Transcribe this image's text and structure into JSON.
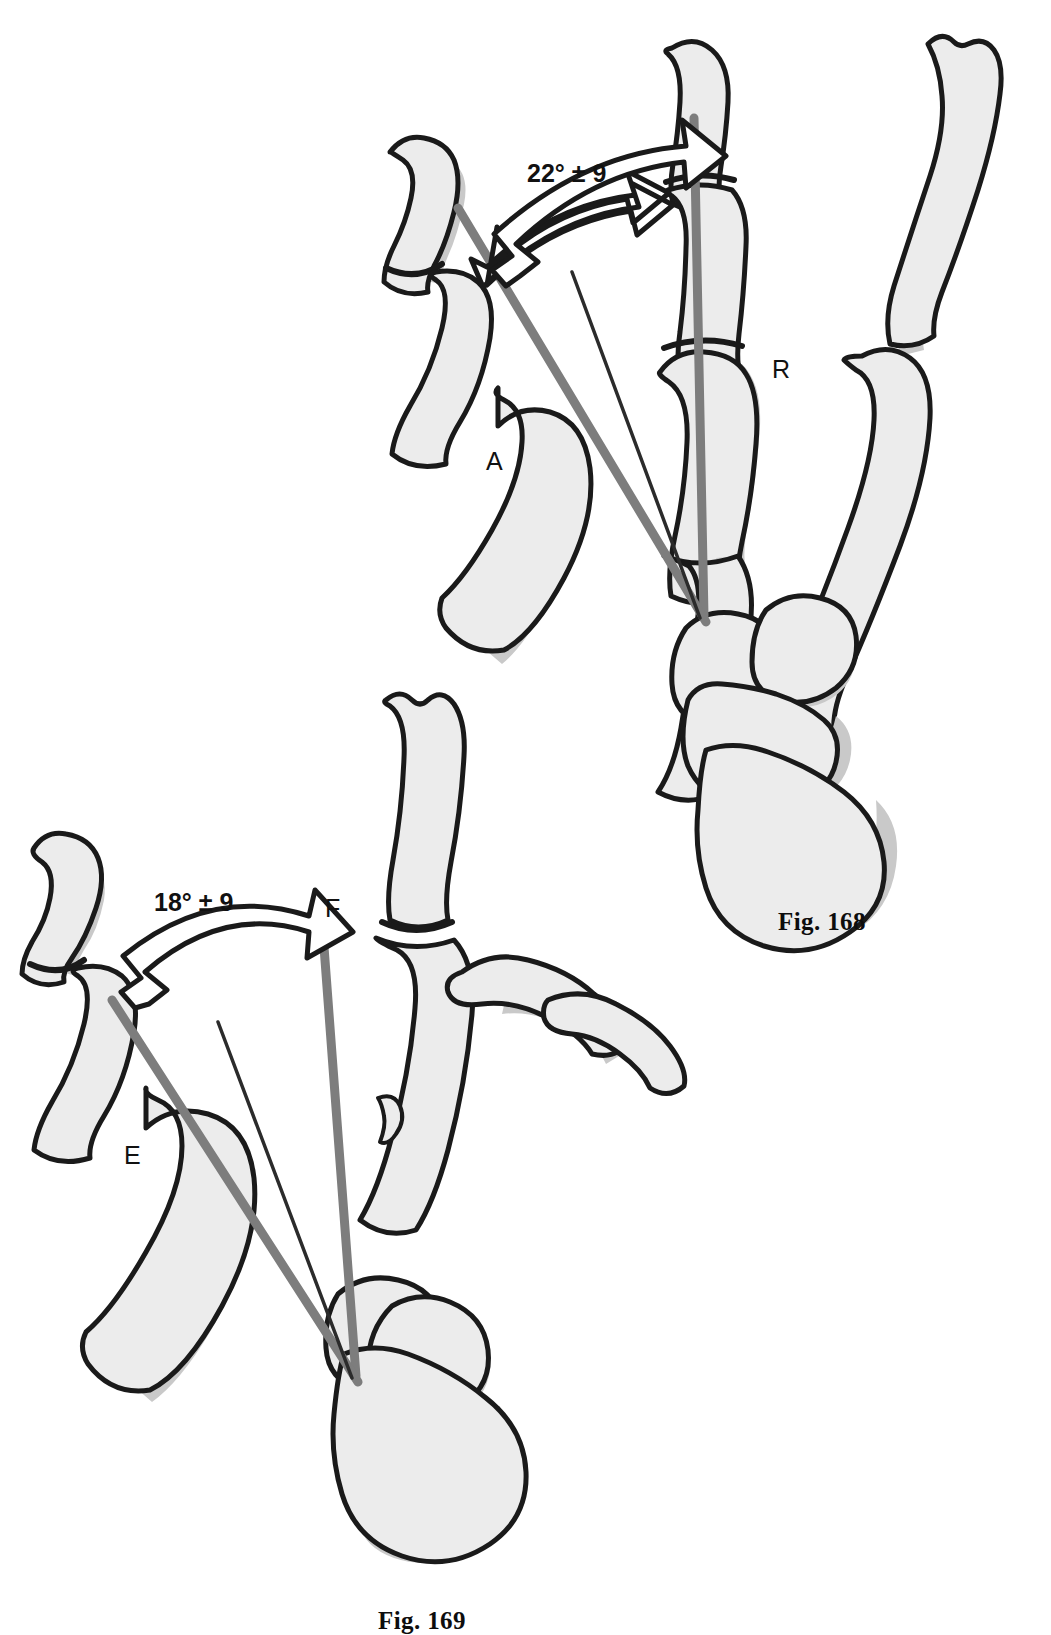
{
  "figure": {
    "type": "anatomical-line-drawing",
    "panels": [
      {
        "id": "upper",
        "caption": "Fig. 168",
        "motion": "abduction-reposition",
        "angle_label": "22° ± 9",
        "angle_value": 22,
        "angle_tolerance": 9,
        "angle_unit": "degrees",
        "axis_labels": [
          {
            "key": "A",
            "text": "A",
            "meaning": "abduction-axis"
          },
          {
            "key": "R",
            "text": "R",
            "meaning": "reference-axis"
          }
        ]
      },
      {
        "id": "lower",
        "caption": "Fig. 169",
        "motion": "extension-flexion",
        "angle_label": "18° ± 9",
        "angle_value": 18,
        "angle_tolerance": 9,
        "angle_unit": "degrees",
        "axis_labels": [
          {
            "key": "E",
            "text": "E",
            "meaning": "extension-axis"
          },
          {
            "key": "F",
            "text": "F",
            "meaning": "flexion-axis"
          }
        ]
      }
    ],
    "colors": {
      "outline": "#1a1a1a",
      "bone_fill": "#ececec",
      "bone_shadow": "#c9c9c9",
      "axis_line": "#7d7d7d",
      "thin_line": "#2b2b2b",
      "arrow_fill": "#ffffff",
      "background": "#ffffff",
      "text": "#111111"
    }
  }
}
